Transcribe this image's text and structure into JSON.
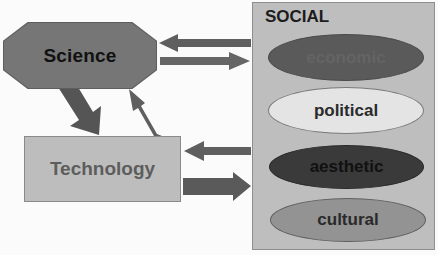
{
  "diagram": {
    "nodes": {
      "science": {
        "label": "Science",
        "fill": "#767676",
        "text_color": "#111111",
        "shape": "octagon"
      },
      "technology": {
        "label": "Technology",
        "fill": "#bdbdbd",
        "text_color": "#5d5d5d",
        "shape": "rectangle"
      },
      "social": {
        "label": "SOCIAL",
        "fill": "#bebebe",
        "text_color": "#1c1c1c",
        "shape": "rectangle",
        "items": [
          {
            "label": "economic",
            "fill": "#5a5a5a",
            "text_color": "#646464"
          },
          {
            "label": "political",
            "fill": "#e4e4e4",
            "text_color": "#2a2a2a"
          },
          {
            "label": "aesthetic",
            "fill": "#3a3a3a",
            "text_color": "#111111"
          },
          {
            "label": "cultural",
            "fill": "#939393",
            "text_color": "#2a2a2a"
          }
        ]
      }
    },
    "edges": [
      {
        "from": "social",
        "to": "science",
        "style": "thin"
      },
      {
        "from": "science",
        "to": "social",
        "style": "thin"
      },
      {
        "from": "science",
        "to": "technology",
        "style": "thick"
      },
      {
        "from": "technology",
        "to": "science",
        "style": "thin"
      },
      {
        "from": "social",
        "to": "technology",
        "style": "thin"
      },
      {
        "from": "technology",
        "to": "social",
        "style": "thick"
      }
    ],
    "arrow_color": "#5f5f5f"
  }
}
